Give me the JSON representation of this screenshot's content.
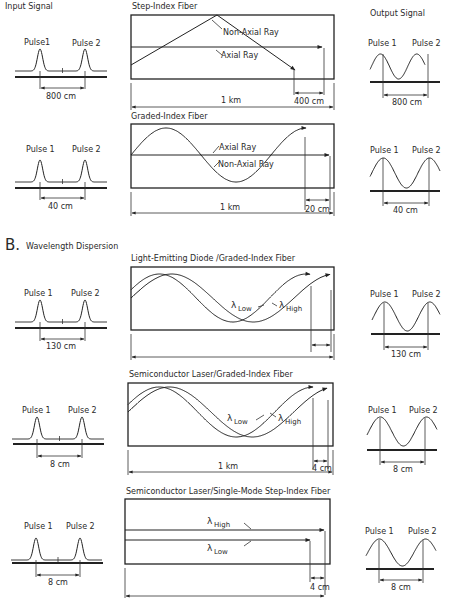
{
  "section_b": {
    "letter": "B.",
    "title": "Wavelength Dispersion"
  },
  "column_titles": {
    "input": "Input Signal",
    "output": "Output Signal"
  },
  "pulse_labels": {
    "pulse1": "Pulse 1",
    "pulse1_top": "Pulse1",
    "pulse2": "Pulse 2"
  },
  "rows": [
    {
      "id": "step-index",
      "fiber_title": "Step-Index Fiber",
      "input_spacing": "800 cm",
      "output_spacing": "800 cm",
      "length": "1 km",
      "delay": "400 cm",
      "ray_labels": [
        "Non-Axial Ray",
        "Axial Ray"
      ]
    },
    {
      "id": "graded-index",
      "fiber_title": "Graded-Index Fiber",
      "input_spacing": "40 cm",
      "output_spacing": "40 cm",
      "length": "1 km",
      "delay": "20 cm",
      "ray_labels": [
        "Axial Ray",
        "Non-Axial Ray"
      ]
    },
    {
      "id": "led-graded",
      "fiber_title": "Light-Emitting Diode /Graded-Index Fiber",
      "input_spacing": "130 cm",
      "output_spacing": "130 cm",
      "length": "",
      "delay": "",
      "wavelengths": {
        "low": "Low",
        "high": "High",
        "lambda": "λ"
      }
    },
    {
      "id": "laser-graded",
      "fiber_title": "Semiconductor Laser/Graded-Index Fiber",
      "input_spacing": "8 cm",
      "output_spacing": "8 cm",
      "length": "1 km",
      "delay": "4 cm",
      "wavelengths": {
        "low": "Low",
        "high": "High",
        "lambda": "λ"
      }
    },
    {
      "id": "laser-singlemode",
      "fiber_title": "Semiconductor Laser/Single-Mode Step-Index Fiber",
      "input_spacing": "8 cm",
      "output_spacing": "8 cm",
      "length": "",
      "delay": "4 cm",
      "wavelengths": {
        "low": "Low",
        "high": "High",
        "lambda": "λ"
      }
    }
  ]
}
